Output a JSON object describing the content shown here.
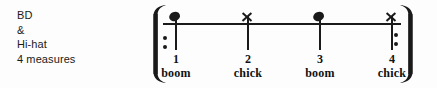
{
  "caption": {
    "lines": [
      "BD",
      "&",
      "Hi-hat",
      "4 measures"
    ]
  },
  "notation": {
    "type": "single-line-percussion-staff",
    "repeat_open": "repeat-sign-open",
    "repeat_close": "repeat-sign-close",
    "bracket_open": "bracket-open-icon",
    "bracket_close": "bracket-close-icon",
    "staff_line": "staff-line",
    "ink_color": "#1a1a1a",
    "background_color": "#fdfdfd",
    "beats": [
      {
        "number": "1",
        "word": "boom",
        "notehead": "filled-notehead",
        "instrument": "BD",
        "x": 176
      },
      {
        "number": "2",
        "word": "chick",
        "notehead": "x-notehead",
        "instrument": "Hi-hat",
        "x": 248
      },
      {
        "number": "3",
        "word": "boom",
        "notehead": "filled-notehead",
        "instrument": "BD",
        "x": 320
      },
      {
        "number": "4",
        "word": "chick",
        "notehead": "x-notehead",
        "instrument": "Hi-hat",
        "x": 392
      }
    ]
  }
}
